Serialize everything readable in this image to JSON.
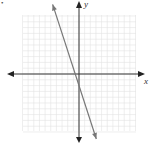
{
  "chart_data": {
    "type": "line",
    "title": "",
    "xlabel": "x",
    "ylabel": "y",
    "xlim": [
      -10,
      10
    ],
    "ylim": [
      -10,
      10
    ],
    "grid": true,
    "grid_step": 1,
    "legend": null,
    "series": [
      {
        "name": "line",
        "equation": "y = -3x - 2",
        "slope": -3,
        "intercept": -2,
        "x": [
          -4,
          2.67
        ],
        "y": [
          10,
          -10
        ],
        "color": "#777777",
        "arrows": "both"
      }
    ]
  },
  "labels": {
    "x_axis": "x",
    "y_axis": "y",
    "corner_marker": "•"
  },
  "colors": {
    "grid": "#e2e2e2",
    "axis": "#333333",
    "line": "#7a7a7a"
  }
}
